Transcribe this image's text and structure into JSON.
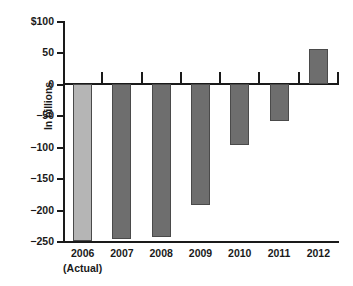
{
  "chart_data": {
    "type": "bar",
    "title": "",
    "xlabel": "",
    "ylabel": "In billions",
    "categories": [
      "2006",
      "2007",
      "2008",
      "2009",
      "2010",
      "2011",
      "2012"
    ],
    "category_sublabels": [
      "(Actual)",
      "",
      "",
      "",
      "",
      "",
      ""
    ],
    "values": [
      -248,
      -245,
      -242,
      -191,
      -95,
      -57,
      57
    ],
    "series": [
      {
        "name": "In billions",
        "values": [
          -248,
          -245,
          -242,
          -191,
          -95,
          -57,
          57
        ]
      }
    ],
    "ylim": [
      -250,
      100
    ],
    "y_ticks": [
      100,
      50,
      0,
      -50,
      -100,
      -150,
      -200,
      -250
    ],
    "y_tick_labels": [
      "$100",
      "50",
      "0",
      "−50",
      "−100",
      "−150",
      "−200",
      "−250"
    ],
    "grid": false,
    "legend": "none",
    "bar_colors": [
      "#b5b5b5",
      "#6e6e6e",
      "#6e6e6e",
      "#6e6e6e",
      "#6e6e6e",
      "#6e6e6e",
      "#6e6e6e"
    ],
    "colors": {
      "actual_bar": "#b5b5b5",
      "projected_bar": "#6e6e6e",
      "axis": "#1a1a1a",
      "background": "#ffffff"
    }
  }
}
